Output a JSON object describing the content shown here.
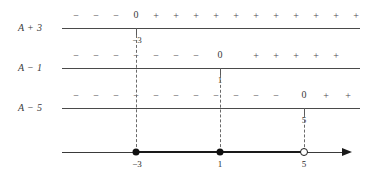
{
  "figure": {
    "width": 376,
    "height": 179,
    "axis_color": "#4a4a4a",
    "ink_color": "#1a1a1a"
  },
  "rows": [
    {
      "label": "A + 3",
      "label_x": 18,
      "label_y": 22,
      "line_y": 28,
      "line_x1": 62,
      "line_x2": 360,
      "sign_y": 11,
      "signs": [
        {
          "text": "−",
          "x": 76
        },
        {
          "text": "−",
          "x": 96
        },
        {
          "text": "−",
          "x": 116
        },
        {
          "text": "+",
          "x": 156
        },
        {
          "text": "+",
          "x": 176
        },
        {
          "text": "+",
          "x": 196
        },
        {
          "text": "+",
          "x": 216
        },
        {
          "text": "+",
          "x": 236
        },
        {
          "text": "+",
          "x": 256
        },
        {
          "text": "+",
          "x": 276
        },
        {
          "text": "+",
          "x": 296
        },
        {
          "text": "+",
          "x": 316
        },
        {
          "text": "+",
          "x": 336
        },
        {
          "text": "+",
          "x": 356
        }
      ],
      "zero": {
        "text": "0",
        "x": 136,
        "y": 10
      },
      "tick": {
        "x": 136,
        "y": 28,
        "height": 7
      },
      "tick_label": {
        "text": "−3",
        "x": 137,
        "y": 36
      }
    },
    {
      "label": "A − 1",
      "label_x": 18,
      "label_y": 62,
      "line_y": 68,
      "line_x1": 62,
      "line_x2": 360,
      "sign_y": 51,
      "signs": [
        {
          "text": "−",
          "x": 76
        },
        {
          "text": "−",
          "x": 96
        },
        {
          "text": "−",
          "x": 116
        },
        {
          "text": "−",
          "x": 136
        },
        {
          "text": "−",
          "x": 156
        },
        {
          "text": "−",
          "x": 176
        },
        {
          "text": "−",
          "x": 196
        },
        {
          "text": "+",
          "x": 256
        },
        {
          "text": "+",
          "x": 276
        },
        {
          "text": "+",
          "x": 296
        },
        {
          "text": "+",
          "x": 316
        },
        {
          "text": "+",
          "x": 336
        }
      ],
      "zero": {
        "text": "0",
        "x": 220,
        "y": 50
      },
      "tick": {
        "x": 220,
        "y": 68,
        "height": 7
      },
      "tick_label": {
        "text": "1",
        "x": 220,
        "y": 76
      }
    },
    {
      "label": "A − 5",
      "label_x": 18,
      "label_y": 102,
      "line_y": 108,
      "line_x1": 62,
      "line_x2": 360,
      "sign_y": 91,
      "signs": [
        {
          "text": "−",
          "x": 76
        },
        {
          "text": "−",
          "x": 96
        },
        {
          "text": "−",
          "x": 116
        },
        {
          "text": "−",
          "x": 136
        },
        {
          "text": "−",
          "x": 156
        },
        {
          "text": "−",
          "x": 176
        },
        {
          "text": "−",
          "x": 196
        },
        {
          "text": "−",
          "x": 216
        },
        {
          "text": "−",
          "x": 236
        },
        {
          "text": "−",
          "x": 256
        },
        {
          "text": "−",
          "x": 276
        },
        {
          "text": "+",
          "x": 326
        },
        {
          "text": "+",
          "x": 348
        }
      ],
      "zero": {
        "text": "0",
        "x": 304,
        "y": 90
      },
      "tick": {
        "x": 304,
        "y": 108,
        "height": 7
      },
      "tick_label": {
        "text": "5",
        "x": 304,
        "y": 116
      }
    }
  ],
  "dashed_lines": [
    {
      "x": 136,
      "y1": 35,
      "y2": 152
    },
    {
      "x": 220,
      "y1": 75,
      "y2": 152
    },
    {
      "x": 304,
      "y1": 115,
      "y2": 152
    }
  ],
  "number_line": {
    "y": 152,
    "x1": 62,
    "x2": 352,
    "arrow_x": 342,
    "thick_segment": {
      "x1": 136,
      "x2": 304
    },
    "points": [
      {
        "value": "−3",
        "x": 136,
        "type": "filled",
        "label_y": 160
      },
      {
        "value": "1",
        "x": 220,
        "type": "filled",
        "label_y": 160
      },
      {
        "value": "5",
        "x": 304,
        "type": "open",
        "label_y": 160
      }
    ]
  }
}
